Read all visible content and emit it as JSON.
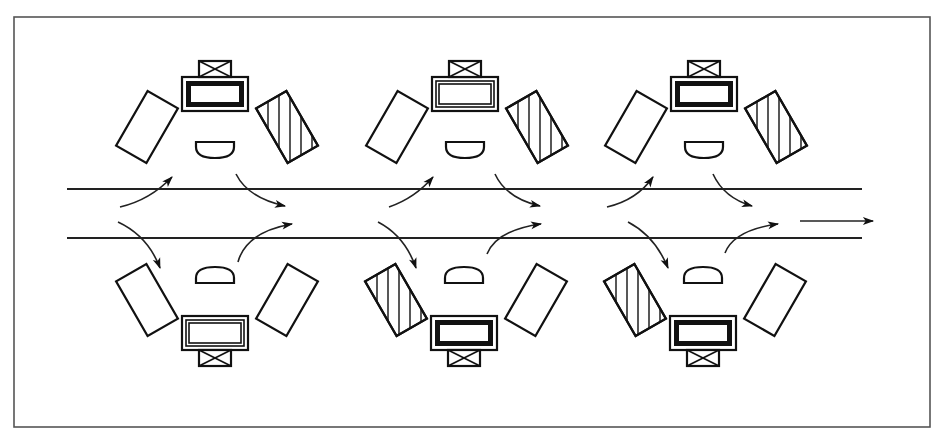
{
  "diagram": {
    "frame": {
      "x": 14,
      "y": 17,
      "w": 916,
      "h": 410
    },
    "colors": {
      "stroke": "#111111",
      "frame": "#555555",
      "background": "#ffffff"
    },
    "aisle_lines": [
      {
        "x1": 67,
        "y1": 189,
        "x2": 862,
        "y2": 189
      },
      {
        "x1": 67,
        "y1": 238,
        "x2": 862,
        "y2": 238
      }
    ],
    "exit_arrow": {
      "x1": 800,
      "y1": 221,
      "x2": 873,
      "y2": 221
    },
    "cells": [
      {
        "id": "top-1",
        "cx": 215,
        "orientation": "top",
        "console_style": "bold",
        "hatched_side": "right"
      },
      {
        "id": "top-2",
        "cx": 465,
        "orientation": "top",
        "console_style": "plain",
        "hatched_side": "right"
      },
      {
        "id": "top-3",
        "cx": 704,
        "orientation": "top",
        "console_style": "bold",
        "hatched_side": "right"
      },
      {
        "id": "bottom-1",
        "cx": 215,
        "orientation": "bottom",
        "console_style": "plain",
        "hatched_side": "none"
      },
      {
        "id": "bottom-2",
        "cx": 464,
        "orientation": "bottom",
        "console_style": "bold",
        "hatched_side": "left"
      },
      {
        "id": "bottom-3",
        "cx": 703,
        "orientation": "bottom",
        "console_style": "bold",
        "hatched_side": "left"
      }
    ],
    "flow_arrows": [
      {
        "d": "M120,207 Q150,200 172,177",
        "head": [
          172,
          177
        ]
      },
      {
        "d": "M236,174 Q248,198 285,206",
        "head": [
          285,
          206
        ]
      },
      {
        "d": "M118,222 Q148,236 160,268",
        "head": [
          160,
          268
        ]
      },
      {
        "d": "M238,262 Q246,232 292,224",
        "head": [
          292,
          224
        ]
      },
      {
        "d": "M389,207 Q415,198 433,177",
        "head": [
          433,
          177
        ]
      },
      {
        "d": "M495,174 Q506,198 540,206",
        "head": [
          540,
          206
        ]
      },
      {
        "d": "M378,222 Q405,236 416,268",
        "head": [
          416,
          268
        ]
      },
      {
        "d": "M487,254 Q497,230 541,224",
        "head": [
          541,
          224
        ]
      },
      {
        "d": "M607,207 Q637,200 653,177",
        "head": [
          653,
          177
        ]
      },
      {
        "d": "M713,174 Q724,198 752,206",
        "head": [
          752,
          206
        ]
      },
      {
        "d": "M628,222 Q655,236 668,268",
        "head": [
          668,
          268
        ]
      },
      {
        "d": "M725,253 Q734,230 778,224",
        "head": [
          778,
          224
        ]
      }
    ]
  }
}
